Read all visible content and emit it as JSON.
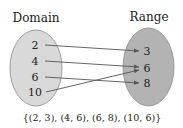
{
  "diagram": {
    "type": "mapping",
    "domain_label": "Domain",
    "range_label": "Range",
    "domain": [
      "2",
      "4",
      "6",
      "10"
    ],
    "range": [
      "3",
      "6",
      "8"
    ],
    "mappings": [
      {
        "from": "2",
        "to": "3"
      },
      {
        "from": "4",
        "to": "6"
      },
      {
        "from": "6",
        "to": "8"
      },
      {
        "from": "10",
        "to": "6"
      }
    ],
    "ordered_pairs": "{(2, 3), (4, 6), (6, 8), (10, 6)}",
    "colors": {
      "domain_fill": "#d9d9d9",
      "range_fill": "#b3b3b3",
      "stroke": "#8a8a8a",
      "arrow": "#555555"
    }
  }
}
